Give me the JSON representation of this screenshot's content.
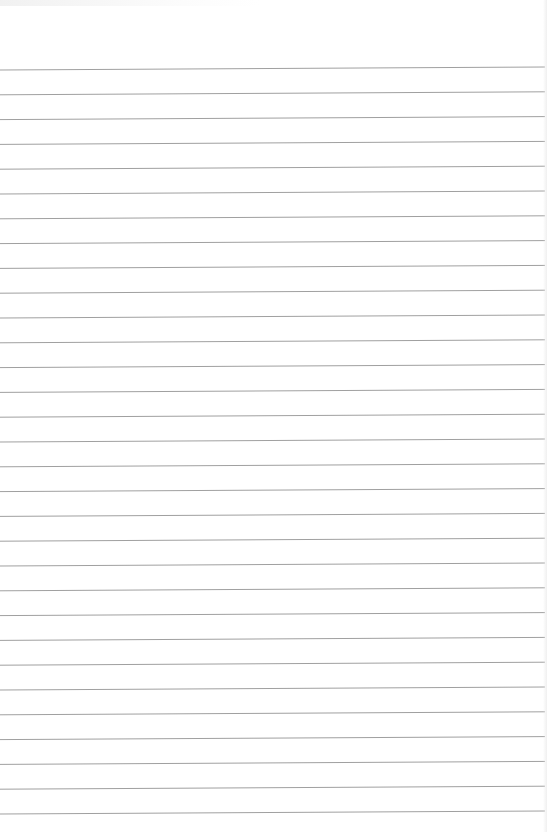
{
  "document": {
    "type": "lined-paper",
    "background_color": "#ffffff",
    "rule_color": "#a0a0a0",
    "rule_count": 31,
    "first_rule_y_left": 70,
    "rule_spacing": 24.8,
    "rule_tilt_px": -3,
    "text_content": ""
  }
}
